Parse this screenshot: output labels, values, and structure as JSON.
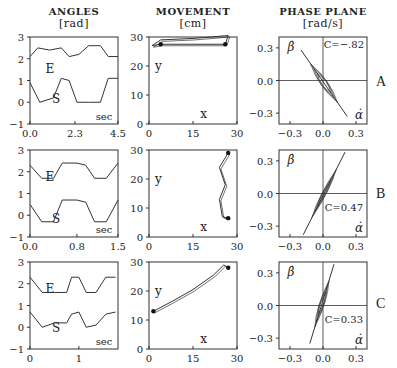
{
  "headers": {
    "angles": {
      "title": "ANGLES",
      "unit": "[rad]"
    },
    "movement": {
      "title": "MOVEMENT",
      "unit": "[cm]"
    },
    "phase": {
      "title": "PHASE PLANE",
      "unit": "[rad/s]"
    }
  },
  "rows": [
    {
      "label": "A",
      "angles_xticks": [
        "0.0",
        "2.3",
        "4.5"
      ],
      "corr": "C=−.82"
    },
    {
      "label": "B",
      "angles_xticks": [
        "0.0",
        "0.8",
        "1.5"
      ],
      "corr": "C=0.47"
    },
    {
      "label": "C",
      "angles_xticks": [
        "0",
        "1"
      ],
      "corr": "C=0.33"
    }
  ],
  "chart_data": [
    {
      "type": "line",
      "title": "ANGLES [rad] - Row A",
      "xlabel": "sec",
      "ylabel": "rad",
      "xlim": [
        0,
        4.5
      ],
      "ylim": [
        -1,
        3
      ],
      "xticks": [
        "0.0",
        "2.3",
        "4.5"
      ],
      "yticks": [
        -1,
        0,
        1,
        2,
        3
      ],
      "series": [
        {
          "name": "E",
          "x": [
            0,
            0.4,
            1.0,
            1.6,
            2.0,
            2.5,
            3.0,
            3.6,
            4.0,
            4.5
          ],
          "values": [
            2.1,
            2.5,
            2.4,
            2.5,
            2.1,
            2.2,
            2.6,
            2.6,
            2.1,
            2.1
          ]
        },
        {
          "name": "S",
          "x": [
            0,
            0.5,
            1.2,
            1.6,
            2.0,
            2.4,
            3.0,
            3.6,
            4.0,
            4.5
          ],
          "values": [
            0.9,
            0.0,
            0.2,
            1.1,
            1.0,
            0.0,
            0.0,
            0.0,
            1.1,
            1.1
          ]
        }
      ]
    },
    {
      "type": "line",
      "title": "ANGLES [rad] - Row B",
      "xlabel": "sec",
      "ylabel": "rad",
      "xlim": [
        0,
        1.5
      ],
      "ylim": [
        -1,
        3
      ],
      "xticks": [
        "0.0",
        "0.8",
        "1.5"
      ],
      "yticks": [
        -1,
        0,
        1,
        2,
        3
      ],
      "series": [
        {
          "name": "E",
          "x": [
            0,
            0.2,
            0.4,
            0.55,
            0.8,
            0.95,
            1.1,
            1.3,
            1.5
          ],
          "values": [
            2.3,
            1.7,
            1.7,
            2.4,
            2.4,
            2.3,
            1.7,
            1.7,
            2.4
          ]
        },
        {
          "name": "S",
          "x": [
            0,
            0.2,
            0.4,
            0.55,
            0.8,
            0.95,
            1.1,
            1.3,
            1.5
          ],
          "values": [
            0.5,
            -0.3,
            -0.3,
            0.7,
            0.7,
            0.6,
            -0.3,
            -0.3,
            0.7
          ]
        }
      ]
    },
    {
      "type": "line",
      "title": "ANGLES [rad] - Row C",
      "xlabel": "sec",
      "ylabel": "rad",
      "xlim": [
        0,
        1.8
      ],
      "ylim": [
        -1,
        3
      ],
      "xticks": [
        "0",
        "1"
      ],
      "yticks": [
        -1,
        0,
        1,
        2,
        3
      ],
      "series": [
        {
          "name": "E",
          "x": [
            0,
            0.25,
            0.5,
            0.75,
            0.85,
            1.0,
            1.15,
            1.35,
            1.55,
            1.75
          ],
          "values": [
            2.3,
            1.6,
            1.6,
            1.6,
            2.3,
            2.3,
            1.6,
            1.6,
            2.3,
            2.3
          ]
        },
        {
          "name": "S",
          "x": [
            0,
            0.25,
            0.5,
            0.75,
            0.85,
            1.0,
            1.15,
            1.35,
            1.55,
            1.75
          ],
          "values": [
            0.7,
            0.0,
            0.2,
            0.2,
            0.6,
            0.7,
            0.0,
            0.1,
            0.6,
            0.7
          ]
        }
      ]
    },
    {
      "type": "line",
      "title": "MOVEMENT [cm] - Row A",
      "xlabel": "x",
      "ylabel": "y",
      "xlim": [
        0,
        30
      ],
      "ylim": [
        0,
        30
      ],
      "xticks": [
        0,
        15,
        30
      ],
      "yticks": [
        0,
        10,
        20,
        30
      ],
      "series": [
        {
          "name": "path",
          "x": [
            1,
            4,
            15,
            27,
            26,
            4,
            1
          ],
          "values": [
            27,
            29,
            29.5,
            30.5,
            27.5,
            27.5,
            27
          ]
        }
      ],
      "endpoints": [
        [
          4,
          27.5
        ],
        [
          26,
          27.5
        ]
      ]
    },
    {
      "type": "line",
      "title": "MOVEMENT [cm] - Row B",
      "xlabel": "x",
      "ylabel": "y",
      "xlim": [
        0,
        30
      ],
      "ylim": [
        0,
        30
      ],
      "xticks": [
        0,
        15,
        30
      ],
      "yticks": [
        0,
        10,
        20,
        30
      ],
      "series": [
        {
          "name": "path",
          "x": [
            27,
            24,
            26,
            24,
            25,
            27
          ],
          "values": [
            29,
            24,
            18,
            13,
            7,
            6.5
          ]
        }
      ],
      "endpoints": [
        [
          27,
          29
        ],
        [
          27,
          6.5
        ]
      ]
    },
    {
      "type": "line",
      "title": "MOVEMENT [cm] - Row C",
      "xlabel": "x",
      "ylabel": "y",
      "xlim": [
        0,
        30
      ],
      "ylim": [
        0,
        30
      ],
      "xticks": [
        0,
        15,
        30
      ],
      "yticks": [
        0,
        10,
        20,
        30
      ],
      "series": [
        {
          "name": "path",
          "x": [
            1.5,
            8,
            15,
            22,
            25.5,
            27
          ],
          "values": [
            13,
            16.5,
            20.5,
            25.5,
            29,
            28
          ]
        }
      ],
      "endpoints": [
        [
          1.5,
          13
        ],
        [
          27,
          28
        ]
      ]
    },
    {
      "type": "scatter",
      "title": "PHASE PLANE [rad/s] - Row A",
      "xlabel": "α̇",
      "ylabel": "β̇",
      "xlim": [
        -0.4,
        0.4
      ],
      "ylim": [
        -0.4,
        0.4
      ],
      "xticks": [
        -0.3,
        0.0,
        0.3
      ],
      "yticks": [
        -0.3,
        0.0,
        0.3
      ],
      "annotation": "C=-.82",
      "regression": {
        "x": [
          -0.2,
          0.22
        ],
        "y": [
          0.28,
          -0.33
        ]
      }
    },
    {
      "type": "scatter",
      "title": "PHASE PLANE [rad/s] - Row B",
      "xlabel": "α̇",
      "ylabel": "β̇",
      "xlim": [
        -0.4,
        0.4
      ],
      "ylim": [
        -0.4,
        0.4
      ],
      "xticks": [
        -0.3,
        0.0,
        0.3
      ],
      "yticks": [
        -0.3,
        0.0,
        0.3
      ],
      "annotation": "C=0.47",
      "regression": {
        "x": [
          -0.18,
          0.2
        ],
        "y": [
          -0.38,
          0.38
        ]
      }
    },
    {
      "type": "scatter",
      "title": "PHASE PLANE [rad/s] - Row C",
      "xlabel": "α̇",
      "ylabel": "β̇",
      "xlim": [
        -0.4,
        0.4
      ],
      "ylim": [
        -0.4,
        0.4
      ],
      "xticks": [
        -0.3,
        0.0,
        0.3
      ],
      "yticks": [
        -0.3,
        0.0,
        0.3
      ],
      "annotation": "C=0.33",
      "regression": {
        "x": [
          -0.12,
          0.1
        ],
        "y": [
          -0.35,
          0.38
        ]
      }
    }
  ]
}
